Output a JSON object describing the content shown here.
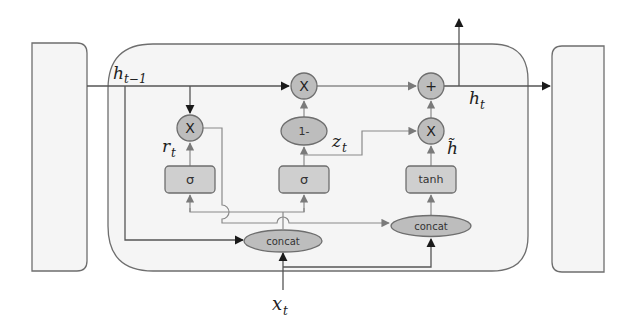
{
  "colors": {
    "background": "#ffffff",
    "block_fill": "#f5f5f5",
    "block_stroke": "#6e6e6e",
    "node_fill": "#bdbdbd",
    "node_stroke": "#6e6e6e",
    "box_fill": "#cfcfcf",
    "line": "#8a8a8a",
    "main_line": "#555555",
    "arrow_dark": "#1a1a1a"
  },
  "nodes": {
    "mult_reset": {
      "symbol": "X"
    },
    "mult_update": {
      "symbol": "X"
    },
    "add_output": {
      "symbol": "+"
    },
    "mult_candidate": {
      "symbol": "X"
    },
    "one_minus": {
      "label": "1-"
    },
    "sigma_reset": {
      "label": "σ"
    },
    "sigma_update": {
      "label": "σ"
    },
    "tanh_box": {
      "label": "tanh"
    },
    "concat_gates": {
      "label": "concat"
    },
    "concat_candidate": {
      "label": "concat"
    }
  },
  "labels": {
    "h_prev": {
      "base": "h",
      "sub": "t−1"
    },
    "h_out": {
      "base": "h",
      "sub": "t"
    },
    "r_t": {
      "base": "r",
      "sub": "t"
    },
    "z_t": {
      "base": "z",
      "sub": "t"
    },
    "h_tilde": {
      "base": "h̃",
      "sub": ""
    },
    "x_t": {
      "base": "x",
      "sub": "t"
    }
  },
  "blocks": {
    "prev_cell": "previous cell",
    "gru_cell": "GRU cell",
    "next_cell": "next cell"
  }
}
